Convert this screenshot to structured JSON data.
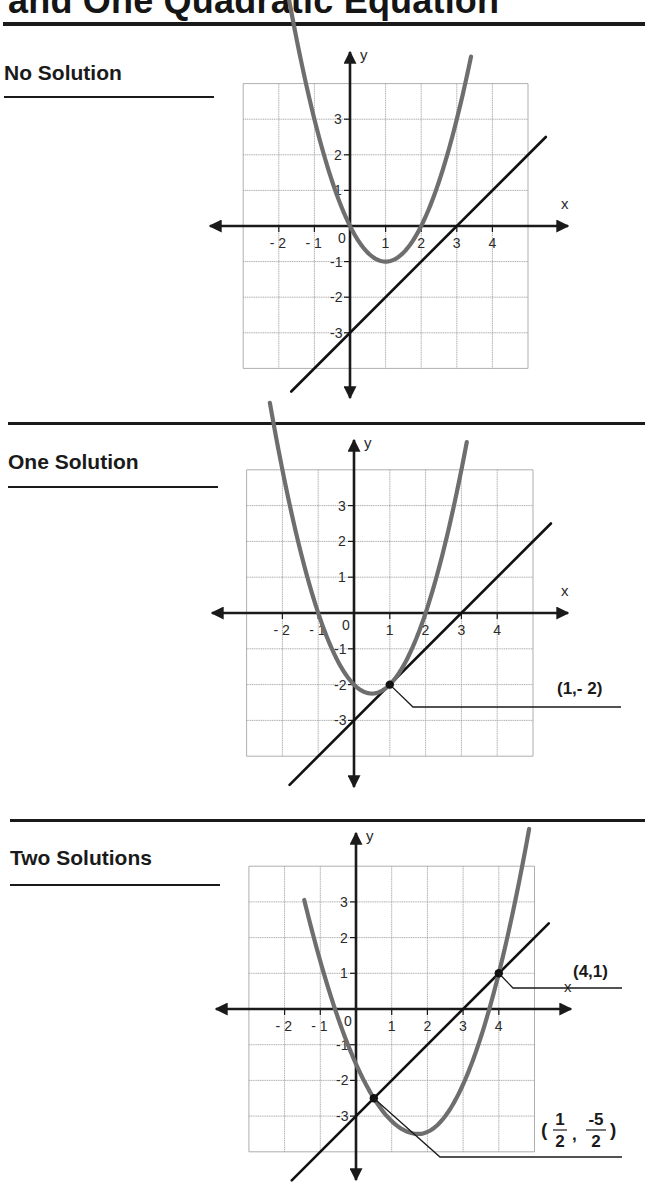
{
  "page": {
    "title": "and One Quadratic Equation"
  },
  "sections": [
    {
      "heading": "No Solution",
      "annotations": []
    },
    {
      "heading": "One Solution",
      "annotations": [
        {
          "point": [
            1,
            -2
          ],
          "label": "(1,- 2)"
        }
      ]
    },
    {
      "heading": "Two Solutions",
      "annotations": [
        {
          "point": [
            4,
            1
          ],
          "label": "(4,1)"
        },
        {
          "point": [
            0.5,
            -2.5
          ],
          "label_parts": {
            "open": "(",
            "num1": "1",
            "den1": "2",
            "comma": ",",
            "num2": "-5",
            "den2": "2",
            "close": ")"
          }
        }
      ]
    }
  ],
  "axes": {
    "x_label": "x",
    "y_label": "y",
    "x_ticks": [
      "- 2",
      "- 1",
      "0",
      "1",
      "2",
      "3",
      "4"
    ],
    "y_ticks": [
      "3",
      "2",
      "1",
      "-1",
      "-2",
      "-3"
    ]
  },
  "chart_data": [
    {
      "type": "line",
      "title": "No Solution",
      "xlabel": "x",
      "ylabel": "y",
      "xlim": [
        -3,
        5
      ],
      "ylim": [
        -4,
        4
      ],
      "grid": true,
      "series": [
        {
          "name": "parabola",
          "equation": "y = x^2 - 2x",
          "vertex": [
            1,
            -1
          ],
          "x_intercepts": [
            0,
            2
          ],
          "color": "#6b6b6b"
        },
        {
          "name": "line",
          "equation": "y = x - 3",
          "y_intercept": -3,
          "x_intercept": 3,
          "color": "#111111"
        }
      ],
      "intersections": []
    },
    {
      "type": "line",
      "title": "One Solution",
      "xlabel": "x",
      "ylabel": "y",
      "xlim": [
        -3,
        5
      ],
      "ylim": [
        -4,
        4
      ],
      "grid": true,
      "series": [
        {
          "name": "parabola",
          "equation": "y = x^2 - x - 2",
          "vertex": [
            0.5,
            -2.25
          ],
          "x_intercepts": [
            -1,
            2
          ],
          "color": "#6b6b6b"
        },
        {
          "name": "line",
          "equation": "y = x - 3",
          "y_intercept": -3,
          "x_intercept": 3,
          "color": "#111111"
        }
      ],
      "intersections": [
        {
          "x": 1,
          "y": -2,
          "label": "(1,- 2)"
        }
      ]
    },
    {
      "type": "line",
      "title": "Two Solutions",
      "xlabel": "x",
      "ylabel": "y",
      "xlim": [
        -3,
        5
      ],
      "ylim": [
        -4,
        4
      ],
      "grid": true,
      "series": [
        {
          "name": "parabola",
          "equation": "y = x^2 - 3.5x - 1",
          "vertex": [
            1.75,
            -3.5
          ],
          "color": "#6b6b6b"
        },
        {
          "name": "line",
          "equation": "y = x - 3",
          "y_intercept": -3,
          "x_intercept": 3,
          "color": "#111111"
        }
      ],
      "intersections": [
        {
          "x": 4,
          "y": 1,
          "label": "(4,1)"
        },
        {
          "x": 0.5,
          "y": -2.5,
          "label": "(1/2, -5/2)"
        }
      ]
    }
  ]
}
